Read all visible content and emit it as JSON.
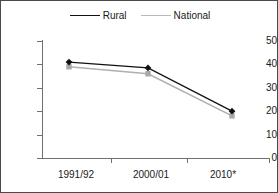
{
  "chart_data": {
    "type": "line",
    "title": "",
    "subtitle": "",
    "xlabel": "",
    "ylabel": "",
    "categories": [
      "1991/92",
      "2000/01",
      "2010*"
    ],
    "series": [
      {
        "name": "Rural",
        "values": [
          41,
          38.5,
          20
        ],
        "color": "#111111",
        "marker": "diamond"
      },
      {
        "name": "National",
        "values": [
          39,
          36,
          18
        ],
        "color": "#a8a8a8",
        "marker": "square"
      }
    ],
    "ylim": [
      0,
      50
    ],
    "yticks": [
      0,
      10,
      20,
      30,
      40,
      50
    ],
    "ytick_labels": [
      "0",
      "10",
      "20",
      "30",
      "40",
      "50"
    ],
    "grid": false,
    "legend_position": "top-center"
  },
  "legend": {
    "entries": [
      {
        "label": "Rural",
        "marker_icon": "diamond-marker-icon"
      },
      {
        "label": "National",
        "marker_icon": "square-marker-icon"
      }
    ]
  },
  "axes": {
    "y_labels": [
      "50",
      "40",
      "30",
      "20",
      "10",
      "0"
    ],
    "x_labels": [
      "1991/92",
      "2000/01",
      "2010*"
    ]
  }
}
